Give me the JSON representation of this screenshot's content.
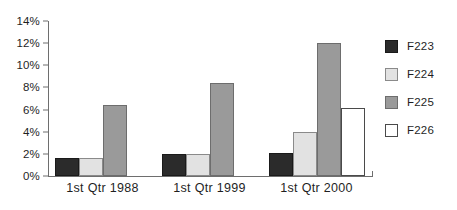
{
  "chart_data": {
    "type": "bar",
    "title": "",
    "subtitle": "",
    "xlabel": "",
    "ylabel": "",
    "categories": [
      "1st Qtr 1988",
      "1st Qtr 1999",
      "1st Qtr 2000"
    ],
    "series": [
      {
        "name": "F223",
        "color": "#2b2b2b",
        "values": [
          1.6,
          2.0,
          2.1
        ]
      },
      {
        "name": "F224",
        "color": "#e2e2e2",
        "values": [
          1.6,
          2.0,
          4.0
        ]
      },
      {
        "name": "F225",
        "color": "#9a9a9a",
        "values": [
          6.4,
          8.4,
          12.0
        ]
      },
      {
        "name": "F226",
        "color": "#ffffff",
        "values": [
          0,
          0,
          6.1
        ]
      }
    ],
    "ylim": [
      0,
      14
    ],
    "ytick_values": [
      0,
      2,
      4,
      6,
      8,
      10,
      12,
      14
    ],
    "ytick_labels": [
      "0%",
      "2%",
      "4%",
      "6%",
      "8%",
      "10%",
      "12%",
      "14%"
    ],
    "grid": false,
    "legend_position": "right",
    "legend_entries": [
      "F223",
      "F224",
      "F225",
      "F226"
    ],
    "value_suffix": "%"
  }
}
